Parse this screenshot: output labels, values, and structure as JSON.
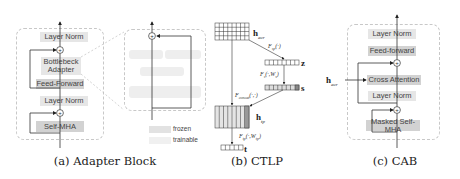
{
  "panel_a": {
    "caption": "(a) Adapter Block",
    "blocks": {
      "layer_norm_top": "Layer Norm",
      "bottleneck_adapter": "Bottlebeck\nAdapter",
      "feed_forward": "Feed-Forward",
      "layer_norm_bottom": "Layer Norm",
      "self_mha": "Self-MHA"
    },
    "legend": {
      "frozen": "frozen",
      "trainable": "trainable"
    },
    "colors": {
      "frozen": "#e6e6e6",
      "trainable": "#d2d2d2"
    }
  },
  "panel_b": {
    "caption": "(b) CTLP",
    "labels": {
      "h_acr": "h",
      "h_acr_sub": "acr",
      "f_sp": "F_sp(·)",
      "z": "z",
      "f_s": "F_s(·,W_s)",
      "s": "s",
      "f_concat": "F_concat(·,·)",
      "h_tp": "h",
      "h_tp_sub": "tp",
      "f_tp": "F_tp(·,W_tp)",
      "t": "t"
    }
  },
  "panel_c": {
    "caption": "(c) CAB",
    "input_label": "h",
    "input_sub": "acr",
    "blocks": {
      "layer_norm_top": "Layer Norm",
      "feed_forward": "Feed-forward",
      "cross_attention": "Cross Attention",
      "layer_norm_mid": "Layer Norm",
      "masked_self_mha": "Masked Self-MHA"
    }
  }
}
